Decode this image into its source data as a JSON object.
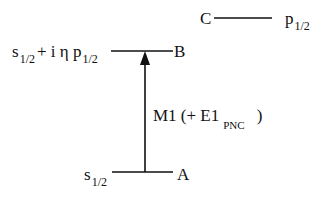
{
  "diagram": {
    "type": "energy-level-diagram",
    "levels": [
      {
        "id": "A",
        "label": "A",
        "state": "s",
        "state_sub": "1/2"
      },
      {
        "id": "B",
        "label": "B",
        "state_prefix": "s",
        "state_prefix_sub": "1/2",
        "mixing": "+ i η p",
        "mixing_sub": "1/2"
      },
      {
        "id": "C",
        "label": "C",
        "state": "p",
        "state_sub": "1/2"
      }
    ],
    "transition": {
      "from": "A",
      "to": "B",
      "label_main": "M1  (+ E1",
      "label_sub": "PNC",
      "label_close": ")"
    },
    "line_color": "#111111"
  }
}
